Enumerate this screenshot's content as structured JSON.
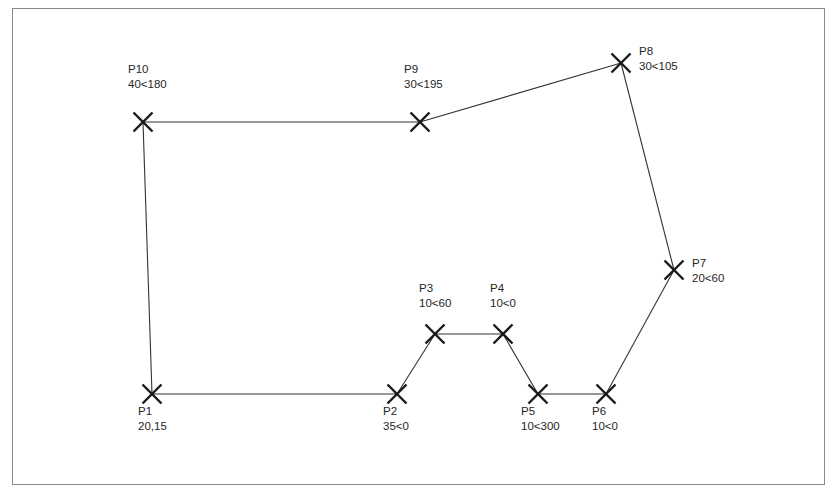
{
  "diagram": {
    "type": "polygon-survey-traverse",
    "frame": {
      "x": 12,
      "y": 8,
      "width": 813,
      "height": 477,
      "border_color": "#8a8a8a"
    },
    "line_color": "#333333",
    "marker_color": "#1a1a1a",
    "marker_glyph": "x-cross-marker",
    "text_color": "#262626",
    "points": [
      {
        "id": "P1",
        "name": "P1",
        "value": "20,15",
        "x": 152,
        "y": 394,
        "label_x": 138,
        "label_y": 404,
        "label_align": "below"
      },
      {
        "id": "P2",
        "name": "P2",
        "value": "35<0",
        "x": 397,
        "y": 394,
        "label_x": 383,
        "label_y": 404,
        "label_align": "below"
      },
      {
        "id": "P3",
        "name": "P3",
        "value": "10<60",
        "x": 435,
        "y": 334,
        "label_x": 419,
        "label_y": 281,
        "label_align": "above"
      },
      {
        "id": "P4",
        "name": "P4",
        "value": "10<0",
        "x": 503,
        "y": 334,
        "label_x": 490,
        "label_y": 281,
        "label_align": "above"
      },
      {
        "id": "P5",
        "name": "P5",
        "value": "10<300",
        "x": 538,
        "y": 394,
        "label_x": 521,
        "label_y": 404,
        "label_align": "below"
      },
      {
        "id": "P6",
        "name": "P6",
        "value": "10<0",
        "x": 606,
        "y": 394,
        "label_x": 592,
        "label_y": 404,
        "label_align": "below"
      },
      {
        "id": "P7",
        "name": "P7",
        "value": "20<60",
        "x": 674,
        "y": 270,
        "label_x": 692,
        "label_y": 256,
        "label_align": "right"
      },
      {
        "id": "P8",
        "name": "P8",
        "value": "30<105",
        "x": 621,
        "y": 63,
        "label_x": 639,
        "label_y": 44,
        "label_align": "right"
      },
      {
        "id": "P9",
        "name": "P9",
        "value": "30<195",
        "x": 420,
        "y": 122,
        "label_x": 404,
        "label_y": 62,
        "label_align": "above"
      },
      {
        "id": "P10",
        "name": "P10",
        "value": "40<180",
        "x": 143,
        "y": 122,
        "label_x": 128,
        "label_y": 62,
        "label_align": "above"
      }
    ],
    "edges": [
      {
        "from": "P1",
        "to": "P2"
      },
      {
        "from": "P2",
        "to": "P3"
      },
      {
        "from": "P3",
        "to": "P4"
      },
      {
        "from": "P4",
        "to": "P5"
      },
      {
        "from": "P5",
        "to": "P6"
      },
      {
        "from": "P6",
        "to": "P7"
      },
      {
        "from": "P7",
        "to": "P8"
      },
      {
        "from": "P8",
        "to": "P9"
      },
      {
        "from": "P9",
        "to": "P10"
      },
      {
        "from": "P10",
        "to": "P1"
      }
    ]
  }
}
